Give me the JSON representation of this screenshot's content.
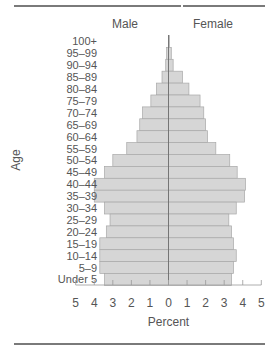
{
  "chart_data": {
    "type": "bar",
    "orientation": "horizontal-population-pyramid",
    "title": "",
    "xlabel": "Percent",
    "ylabel": "Age",
    "legend": [
      "Male",
      "Female"
    ],
    "categories": [
      "100+",
      "95–99",
      "90–94",
      "85–89",
      "80–84",
      "75–79",
      "70–74",
      "65–69",
      "60–64",
      "55–59",
      "50–54",
      "45–49",
      "40–44",
      "35–39",
      "30–34",
      "25–29",
      "20–24",
      "15–19",
      "10–14",
      "5–9",
      "Under 5"
    ],
    "series": [
      {
        "name": "Male",
        "color": "#d6d6d6",
        "values": [
          0.0,
          0.1,
          0.15,
          0.35,
          0.65,
          0.95,
          1.4,
          1.55,
          1.7,
          2.25,
          3.0,
          3.45,
          4.0,
          4.0,
          3.45,
          3.15,
          3.35,
          3.7,
          3.7,
          3.7,
          3.45
        ]
      },
      {
        "name": "Female",
        "color": "#d6d6d6",
        "values": [
          0.05,
          0.15,
          0.25,
          0.75,
          1.1,
          1.7,
          1.9,
          2.0,
          2.1,
          2.55,
          3.3,
          3.7,
          4.15,
          4.1,
          3.65,
          3.25,
          3.4,
          3.5,
          3.65,
          3.5,
          3.4
        ]
      }
    ],
    "x_ticks": [
      "5",
      "4",
      "3",
      "2",
      "1",
      "0",
      "1",
      "2",
      "3",
      "4",
      "5"
    ],
    "xlim": [
      -5,
      5
    ],
    "grid": false
  }
}
